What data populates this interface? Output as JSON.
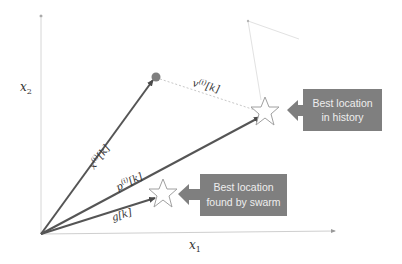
{
  "diagram": {
    "type": "particle-swarm-vector-diagram",
    "axes": {
      "x_label": "x",
      "x_subscript": "1",
      "y_label": "x",
      "y_subscript": "2",
      "origin": [
        41,
        234
      ],
      "x_end": [
        337,
        231
      ],
      "y_end": [
        41,
        16
      ]
    },
    "vectors": [
      {
        "id": "position",
        "label_main": "x",
        "label_sup": "(i)",
        "label_tail": "[k]",
        "from": [
          41,
          234
        ],
        "to": [
          154,
          79
        ],
        "color": "#555555"
      },
      {
        "id": "personal-best",
        "label_main": "p",
        "label_sup": "(i)",
        "label_tail": "[k]",
        "from": [
          41,
          234
        ],
        "to": [
          262,
          116
        ],
        "color": "#555555"
      },
      {
        "id": "global-best",
        "label_main": "g",
        "label_sup": "",
        "label_tail": "[k]",
        "from": [
          41,
          234
        ],
        "to": [
          157,
          198
        ],
        "color": "#555555"
      }
    ],
    "velocity": {
      "label_main": "v",
      "label_sup": "(i)",
      "label_tail": "[k]",
      "from": [
        156,
        77
      ],
      "to": [
        262,
        112
      ]
    },
    "particle_dot": {
      "cx": 156,
      "cy": 77,
      "r": 5,
      "color": "#7f7f7f"
    },
    "stars": [
      {
        "id": "history-star",
        "cx": 265,
        "cy": 112
      },
      {
        "id": "swarm-star",
        "cx": 163,
        "cy": 194
      }
    ],
    "faint_path": [
      [
        261,
        100
      ],
      [
        248,
        21
      ],
      [
        299,
        39
      ]
    ],
    "callouts": [
      {
        "id": "history",
        "line1": "Best location",
        "line2": "in history",
        "color": "#7f7f7f"
      },
      {
        "id": "swarm",
        "line1": "Best location",
        "line2": "found by swarm",
        "color": "#7f7f7f"
      }
    ]
  }
}
